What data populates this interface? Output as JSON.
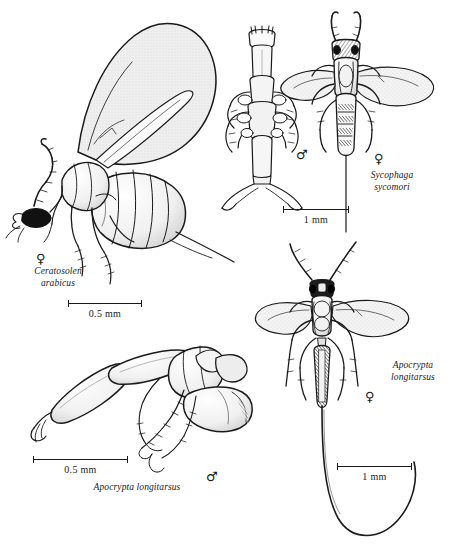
{
  "plate": {
    "type": "scientific-illustration-plate",
    "subject": "fig wasps (Agaonidae and associates) line drawings",
    "background_color": "#ffffff",
    "ink_color": "#1a1a1a",
    "wing_fill_color": "#e9e9e9"
  },
  "figures": [
    {
      "id": "ceratosolen-arabicus-female",
      "species": "Ceratosolen\narabicus",
      "sex_symbol": "♀",
      "sex": "female",
      "view": "lateral",
      "winged": true,
      "scale_label": "0.5 mm"
    },
    {
      "id": "sycophaga-sycomori-male",
      "species": "",
      "sex_symbol": "♂",
      "sex": "male",
      "view": "dorsal",
      "winged": false,
      "scale_label": "1 mm"
    },
    {
      "id": "sycophaga-sycomori-female",
      "species": "Sycophaga\nsycomori",
      "sex_symbol": "♀",
      "sex": "female",
      "view": "dorsal",
      "winged": true,
      "scale_label": "1 mm"
    },
    {
      "id": "apocrypta-longitarsus-female",
      "species": "Apocrypta\nlongitarsus",
      "sex_symbol": "♀",
      "sex": "female",
      "view": "dorsal",
      "winged": true,
      "scale_label": "1 mm"
    },
    {
      "id": "apocrypta-longitarsus-male",
      "species": "Apocrypta longitarsus",
      "sex_symbol": "♂",
      "sex": "male",
      "view": "lateral",
      "winged": false,
      "scale_label": "0.5 mm"
    }
  ],
  "scale_bars": [
    {
      "id": "scale-ceratosolen",
      "label": "0.5 mm"
    },
    {
      "id": "scale-sycophaga",
      "label": "1 mm"
    },
    {
      "id": "scale-apocrypta-male",
      "label": "0.5 mm"
    },
    {
      "id": "scale-apocrypta-female",
      "label": "1 mm"
    }
  ]
}
